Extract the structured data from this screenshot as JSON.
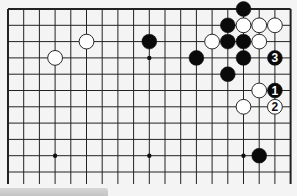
{
  "board": {
    "size": 19,
    "visible_rows": 11,
    "top_edge_visible": true,
    "left_edge_visible": true,
    "right_edge_visible": true,
    "bottom_edge_visible": false,
    "origin": {
      "x": 8,
      "y": 9
    },
    "col_spacing": 15.7,
    "row_spacing": 16.3,
    "line_color": "#222222",
    "background": "#f4f4f4",
    "star_points": [
      {
        "col": 9,
        "row": 3
      },
      {
        "col": 3,
        "row": 9
      },
      {
        "col": 9,
        "row": 9
      },
      {
        "col": 15,
        "row": 9
      }
    ],
    "stones": [
      {
        "color": "black",
        "col": 15,
        "row": 0
      },
      {
        "color": "black",
        "col": 14,
        "row": 1
      },
      {
        "color": "white",
        "col": 15,
        "row": 1
      },
      {
        "color": "white",
        "col": 16,
        "row": 1
      },
      {
        "color": "white",
        "col": 17,
        "row": 1
      },
      {
        "color": "white",
        "col": 5,
        "row": 2
      },
      {
        "color": "black",
        "col": 9,
        "row": 2
      },
      {
        "color": "white",
        "col": 13,
        "row": 2
      },
      {
        "color": "black",
        "col": 14,
        "row": 2
      },
      {
        "color": "black",
        "col": 15,
        "row": 2
      },
      {
        "color": "white",
        "col": 16,
        "row": 2
      },
      {
        "color": "white",
        "col": 3,
        "row": 3
      },
      {
        "color": "black",
        "col": 12,
        "row": 3
      },
      {
        "color": "black",
        "col": 15,
        "row": 3
      },
      {
        "color": "black",
        "col": 17,
        "row": 3,
        "label": "3"
      },
      {
        "color": "black",
        "col": 14,
        "row": 4
      },
      {
        "color": "white",
        "col": 16,
        "row": 5
      },
      {
        "color": "black",
        "col": 17,
        "row": 5,
        "label": "1"
      },
      {
        "color": "white",
        "col": 15,
        "row": 6
      },
      {
        "color": "white",
        "col": 17,
        "row": 6,
        "label": "2"
      },
      {
        "color": "black",
        "col": 16,
        "row": 9
      }
    ]
  },
  "caption": {
    "text": ""
  }
}
